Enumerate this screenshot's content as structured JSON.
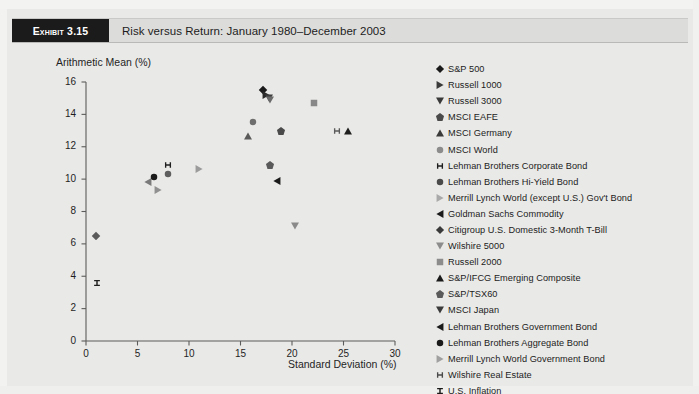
{
  "exhibit": {
    "tag": "Exhibit 3.15",
    "title": "Risk versus Return: January 1980–December 2003"
  },
  "chart_data": {
    "type": "scatter",
    "title": "Risk versus Return: January 1980–December 2003",
    "xlabel": "Standard Deviation (%)",
    "ylabel": "Arithmetic Mean (%)",
    "xlim": [
      0,
      30
    ],
    "ylim": [
      0,
      16
    ],
    "xticks": [
      0,
      5,
      10,
      15,
      20,
      25,
      30
    ],
    "yticks": [
      0,
      2,
      4,
      6,
      8,
      10,
      12,
      14,
      16
    ],
    "grid": false,
    "legend_position": "right",
    "series": [
      {
        "name": "S&P 500",
        "marker": "diamond",
        "color": "#1a1a1a",
        "x": 17.2,
        "y": 15.5
      },
      {
        "name": "Russell 1000",
        "marker": "triangle-right",
        "color": "#2a2a2a",
        "x": 17.5,
        "y": 15.2
      },
      {
        "name": "Russell 3000",
        "marker": "triangle-down",
        "color": "#3d3d3d",
        "x": 17.8,
        "y": 15.0
      },
      {
        "name": "MSCI EAFE",
        "marker": "pentagon",
        "color": "#5a5a5a",
        "x": 17.9,
        "y": 10.85
      },
      {
        "name": "MSCI Germany",
        "marker": "triangle-up",
        "color": "#1e1e1e",
        "x": 25.4,
        "y": 13.0
      },
      {
        "name": "MSCI World",
        "marker": "circle",
        "color": "#6e6e6e",
        "x": 16.2,
        "y": 13.5
      },
      {
        "name": "Lehman Brothers Corporate Bond",
        "marker": "i-beam-h",
        "color": "#1e1e1e",
        "x": 8.0,
        "y": 10.9
      },
      {
        "name": "Lehman Brothers Hi-Yield Bond",
        "marker": "circle",
        "color": "#5e5e5e",
        "x": 8.0,
        "y": 10.3
      },
      {
        "name": "Merrill Lynch World (except U.S.) Gov't Bond",
        "marker": "triangle-right",
        "color": "#9b9b9b",
        "x": 11.0,
        "y": 10.6
      },
      {
        "name": "Goldman Sachs Commodity",
        "marker": "triangle-left",
        "color": "#1a1a1a",
        "x": 18.5,
        "y": 9.9
      },
      {
        "name": "Citigroup U.S. Domestic 3-Month T-Bill",
        "marker": "diamond",
        "color": "#5a5a5a",
        "x": 1.0,
        "y": 6.5
      },
      {
        "name": "Wilshire 5000",
        "marker": "triangle-down",
        "color": "#8a8a8a",
        "x": 20.3,
        "y": 7.1
      },
      {
        "name": "Russell 2000",
        "marker": "square",
        "color": "#888888",
        "x": 22.1,
        "y": 14.7
      },
      {
        "name": "S&P/IFCG Emerging Composite",
        "marker": "triangle-up",
        "color": "#5a5a5a",
        "x": 15.7,
        "y": 12.65
      },
      {
        "name": "S&P/TSX60",
        "marker": "pentagon",
        "color": "#4a4a4a",
        "x": 18.9,
        "y": 13.0
      },
      {
        "name": "MSCI Japan",
        "marker": "triangle-down",
        "color": "#6a6a6a",
        "x": 17.9,
        "y": 14.9
      },
      {
        "name": "Lehman Brothers Government Bond",
        "marker": "triangle-left",
        "color": "#7a7a7a",
        "x": 6.0,
        "y": 9.8
      },
      {
        "name": "Lehman Brothers Aggregate Bond",
        "marker": "circle",
        "color": "#1a1a1a",
        "x": 6.6,
        "y": 10.15
      },
      {
        "name": "Merrill Lynch World Government Bond",
        "marker": "triangle-right",
        "color": "#909090",
        "x": 7.0,
        "y": 9.3
      },
      {
        "name": "Wilshire Real Estate",
        "marker": "i-beam-h",
        "color": "#5a5a5a",
        "x": 24.4,
        "y": 12.95
      },
      {
        "name": "U.S. Inflation",
        "marker": "i-beam-v",
        "color": "#1e1e1e",
        "x": 1.1,
        "y": 3.6
      }
    ]
  },
  "legend": {
    "items": [
      {
        "label": "S&P 500",
        "marker": "diamond",
        "color": "#1a1a1a"
      },
      {
        "label": "Russell 1000",
        "marker": "triangle-right",
        "color": "#3a3a3a"
      },
      {
        "label": "Russell 3000",
        "marker": "triangle-down",
        "color": "#3a3a3a"
      },
      {
        "label": "MSCI EAFE",
        "marker": "pentagon",
        "color": "#4a4a4a"
      },
      {
        "label": "MSCI Germany",
        "marker": "triangle-up",
        "color": "#3a3a3a"
      },
      {
        "label": "MSCI World",
        "marker": "circle",
        "color": "#8c8c8c"
      },
      {
        "label": "Lehman Brothers Corporate Bond",
        "marker": "i-beam-h",
        "color": "#1e1e1e"
      },
      {
        "label": "Lehman Brothers Hi-Yield Bond",
        "marker": "circle",
        "color": "#4a4a4a"
      },
      {
        "label": "Merrill Lynch World (except U.S.) Gov't Bond",
        "marker": "triangle-right",
        "color": "#a9a9a9"
      },
      {
        "label": "Goldman Sachs Commodity",
        "marker": "triangle-left",
        "color": "#1a1a1a"
      },
      {
        "label": "Citigroup U.S. Domestic 3-Month T-Bill",
        "marker": "diamond",
        "color": "#3a3a3a"
      },
      {
        "label": "Wilshire 5000",
        "marker": "triangle-down",
        "color": "#8c8c8c"
      },
      {
        "label": "Russell 2000",
        "marker": "square",
        "color": "#8c8c8c"
      },
      {
        "label": "S&P/IFCG Emerging Composite",
        "marker": "triangle-up",
        "color": "#1a1a1a"
      },
      {
        "label": "S&P/TSX60",
        "marker": "pentagon",
        "color": "#5a5a5a"
      },
      {
        "label": "MSCI Japan",
        "marker": "triangle-down",
        "color": "#3a3a3a"
      },
      {
        "label": "Lehman Brothers Government Bond",
        "marker": "triangle-left",
        "color": "#1a1a1a"
      },
      {
        "label": "Lehman Brothers Aggregate Bond",
        "marker": "circle",
        "color": "#1a1a1a"
      },
      {
        "label": "Merrill Lynch World Government Bond",
        "marker": "triangle-right",
        "color": "#a0a0a0"
      },
      {
        "label": "Wilshire Real Estate",
        "marker": "i-beam-h",
        "color": "#4a4a4a"
      },
      {
        "label": "U.S. Inflation",
        "marker": "i-beam-v",
        "color": "#1a1a1a"
      }
    ]
  }
}
